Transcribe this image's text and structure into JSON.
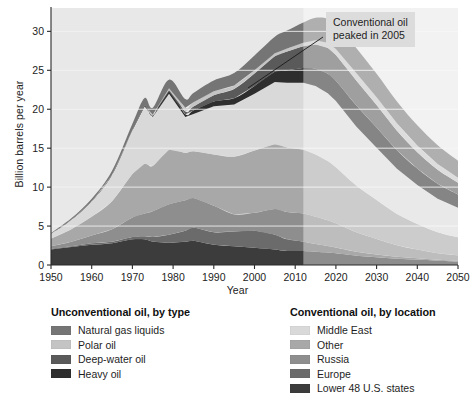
{
  "chart_data": {
    "type": "area",
    "stacking": "stacked",
    "title": "",
    "xlabel": "Year",
    "ylabel": "Billion barrels per year",
    "xlim": [
      1950,
      2050
    ],
    "ylim": [
      0,
      33
    ],
    "xticks": [
      1950,
      1960,
      1970,
      1980,
      1990,
      2000,
      2010,
      2020,
      2030,
      2040,
      2050
    ],
    "yticks": [
      0,
      5,
      10,
      15,
      20,
      25,
      30
    ],
    "grid": "horizontal",
    "legend_position": "below-plot",
    "forecast_start_year": 2012,
    "annotations": [
      {
        "text_line_1": "Conventional oil",
        "text_line_2": "peaked in 2005",
        "points_to_year": 2005,
        "points_to_value": 26.0
      }
    ],
    "x": [
      1950,
      1955,
      1960,
      1965,
      1970,
      1973,
      1975,
      1979,
      1983,
      1985,
      1990,
      1995,
      2000,
      2005,
      2008,
      2012,
      2015,
      2018,
      2020,
      2025,
      2030,
      2035,
      2040,
      2045,
      2050
    ],
    "series": [
      {
        "name": "Lower 48 U.S. states",
        "group": "Conventional oil, by location",
        "color": "#3c3c3c",
        "values": [
          2.0,
          2.3,
          2.6,
          2.8,
          3.3,
          3.3,
          3.0,
          2.9,
          3.0,
          3.1,
          2.6,
          2.4,
          2.2,
          2.0,
          1.8,
          1.8,
          1.7,
          1.6,
          1.5,
          1.2,
          1.0,
          0.8,
          0.7,
          0.55,
          0.45
        ]
      },
      {
        "name": "Europe",
        "group": "Conventional oil, by location",
        "color": "#6b6b6b",
        "values": [
          0.1,
          0.1,
          0.2,
          0.2,
          0.3,
          0.4,
          0.6,
          1.0,
          1.4,
          1.7,
          1.6,
          1.9,
          2.2,
          1.9,
          1.5,
          1.2,
          1.0,
          0.85,
          0.75,
          0.5,
          0.35,
          0.25,
          0.18,
          0.12,
          0.1
        ]
      },
      {
        "name": "Russia",
        "group": "Conventional oil, by location",
        "color": "#8e8e8e",
        "values": [
          0.3,
          0.6,
          1.0,
          1.6,
          2.5,
          2.9,
          3.3,
          3.9,
          3.9,
          3.8,
          3.4,
          2.2,
          2.3,
          3.3,
          3.5,
          3.6,
          3.5,
          3.3,
          3.1,
          2.5,
          2.0,
          1.5,
          1.1,
          0.85,
          0.7
        ]
      },
      {
        "name": "Other",
        "group": "Conventional oil, by location",
        "color": "#a8a8a8",
        "values": [
          1.0,
          1.6,
          2.4,
          3.6,
          5.6,
          6.4,
          5.8,
          7.0,
          6.1,
          6.0,
          6.6,
          7.4,
          8.0,
          8.3,
          8.3,
          8.2,
          8.0,
          7.6,
          7.2,
          6.0,
          5.0,
          4.0,
          3.3,
          2.7,
          2.3
        ]
      },
      {
        "name": "Middle East",
        "group": "Conventional oil, by location",
        "color": "#d9d9d9",
        "values": [
          0.6,
          1.2,
          2.0,
          3.4,
          5.6,
          7.4,
          6.3,
          7.2,
          4.6,
          4.8,
          6.2,
          6.7,
          7.3,
          8.0,
          8.3,
          8.6,
          8.8,
          8.7,
          8.5,
          7.6,
          6.7,
          5.8,
          5.0,
          4.3,
          3.8
        ]
      },
      {
        "name": "Heavy oil",
        "group": "Unconventional oil, by type",
        "color": "#2e2e2e",
        "values": [
          0.0,
          0.0,
          0.0,
          0.0,
          0.05,
          0.1,
          0.15,
          0.25,
          0.35,
          0.45,
          0.6,
          0.8,
          1.0,
          1.3,
          1.6,
          1.9,
          2.2,
          2.5,
          2.6,
          2.7,
          2.6,
          2.4,
          2.1,
          1.9,
          1.7
        ]
      },
      {
        "name": "Deep-water oil",
        "group": "Unconventional oil, by type",
        "color": "#5a5a5a",
        "values": [
          0.0,
          0.0,
          0.0,
          0.0,
          0.0,
          0.05,
          0.1,
          0.2,
          0.35,
          0.5,
          0.8,
          1.2,
          1.6,
          2.0,
          2.4,
          2.8,
          3.1,
          3.3,
          3.3,
          3.2,
          2.9,
          2.5,
          2.1,
          1.8,
          1.5
        ]
      },
      {
        "name": "Polar oil",
        "group": "Unconventional oil, by type",
        "color": "#c4c4c4",
        "values": [
          0.0,
          0.0,
          0.0,
          0.0,
          0.0,
          0.0,
          0.05,
          0.25,
          0.5,
          0.55,
          0.5,
          0.45,
          0.4,
          0.4,
          0.4,
          0.45,
          0.55,
          0.7,
          0.8,
          0.95,
          1.0,
          0.95,
          0.85,
          0.75,
          0.65
        ]
      },
      {
        "name": "Natural gas liquids",
        "group": "Unconventional oil, by type",
        "color": "#757575",
        "values": [
          0.1,
          0.2,
          0.3,
          0.5,
          0.8,
          0.9,
          0.9,
          1.1,
          1.1,
          1.2,
          1.4,
          1.6,
          1.9,
          2.1,
          2.3,
          2.6,
          2.9,
          3.1,
          3.2,
          3.2,
          3.0,
          2.8,
          2.6,
          2.4,
          2.2
        ]
      }
    ]
  },
  "annotation": {
    "line1": "Conventional oil",
    "line2": "peaked in 2005"
  },
  "axes": {
    "ylabel": "Billion barrels per year",
    "xlabel": "Year"
  },
  "legend": {
    "unconventional": {
      "title": "Unconventional oil, by type",
      "items": [
        {
          "label": "Natural gas liquids",
          "color": "#757575"
        },
        {
          "label": "Polar oil",
          "color": "#c4c4c4"
        },
        {
          "label": "Deep-water oil",
          "color": "#5a5a5a"
        },
        {
          "label": "Heavy oil",
          "color": "#2e2e2e"
        }
      ]
    },
    "conventional": {
      "title": "Conventional oil, by location",
      "items": [
        {
          "label": "Middle East",
          "color": "#d9d9d9"
        },
        {
          "label": "Other",
          "color": "#a8a8a8"
        },
        {
          "label": "Russia",
          "color": "#8e8e8e"
        },
        {
          "label": "Europe",
          "color": "#6b6b6b"
        },
        {
          "label": "Lower 48 U.S. states",
          "color": "#3c3c3c"
        }
      ]
    }
  },
  "colors": {
    "plot_background": "#e8e8e8",
    "forecast_overlay": "#ffffff",
    "axis": "#2a2a2a",
    "gridline": "#f4f4f4",
    "annotation_background": "#dcdcdc"
  }
}
